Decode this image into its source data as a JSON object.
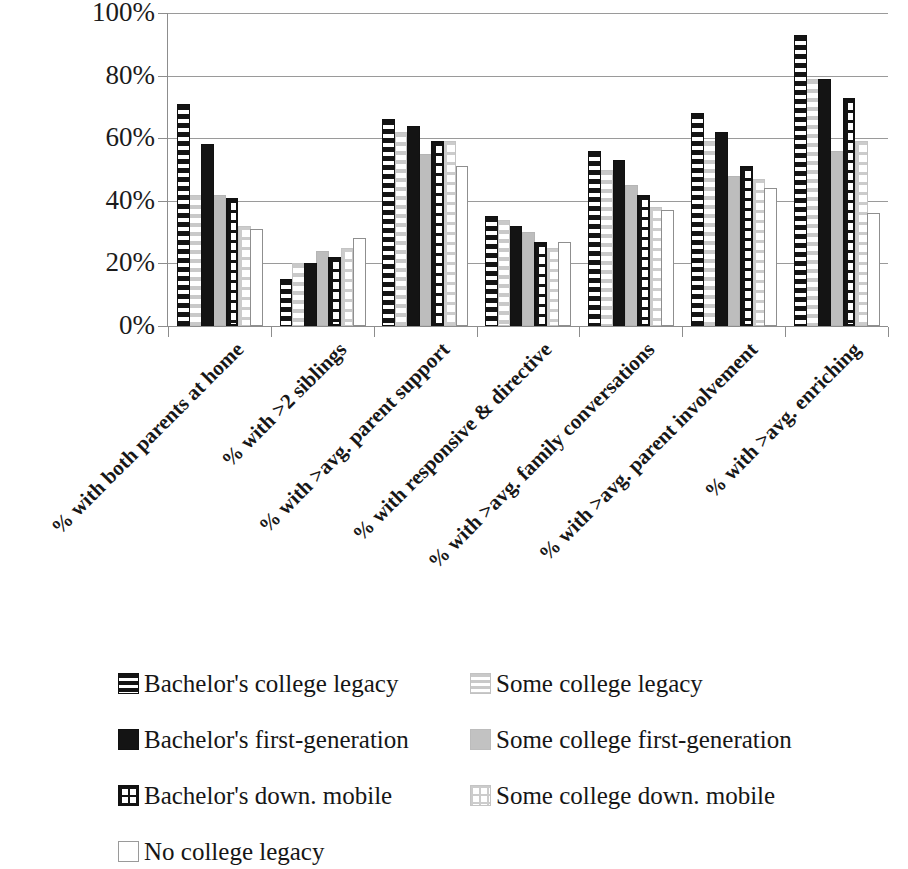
{
  "chart_data": {
    "type": "bar",
    "title": "",
    "subtitle": "",
    "xlabel": "",
    "ylabel": "",
    "ylim": [
      0,
      100
    ],
    "y_ticks": [
      "0%",
      "20%",
      "40%",
      "60%",
      "80%",
      "100%"
    ],
    "y_tick_values": [
      0,
      20,
      40,
      60,
      80,
      100
    ],
    "grid": "horizontal",
    "legend_position": "bottom",
    "categories": [
      "% with both parents at home",
      "% with >2 siblings",
      "% with >avg. parent support",
      "% with responsive & directive",
      "% with >avg. family conversations",
      "% with >avg. parent involvement",
      "% with >avg. enriching"
    ],
    "series": [
      {
        "name": "Bachelor's college legacy",
        "key": "bach-legacy",
        "values": [
          71,
          15,
          66,
          35,
          56,
          68,
          93
        ]
      },
      {
        "name": "Some college legacy",
        "key": "some-legacy",
        "values": [
          42,
          20,
          62,
          34,
          50,
          59,
          79
        ]
      },
      {
        "name": "Bachelor's first-generation",
        "key": "bach-firstgen",
        "values": [
          58,
          20,
          64,
          32,
          53,
          62,
          79
        ]
      },
      {
        "name": "Some college first-generation",
        "key": "some-firstgen",
        "values": [
          42,
          24,
          55,
          30,
          45,
          48,
          56
        ]
      },
      {
        "name": "Bachelor's down. mobile",
        "key": "bach-down",
        "values": [
          41,
          22,
          59,
          27,
          42,
          51,
          73
        ]
      },
      {
        "name": "Some college down. mobile",
        "key": "some-down",
        "values": [
          32,
          25,
          59,
          25,
          38,
          47,
          59
        ]
      },
      {
        "name": "No college legacy",
        "key": "no-legacy",
        "values": [
          31,
          28,
          51,
          27,
          37,
          44,
          36
        ]
      }
    ]
  },
  "legend": {
    "items": [
      {
        "label": "Bachelor's college legacy",
        "swatch": "sw-bach-legacy",
        "column": 0,
        "row": 0
      },
      {
        "label": "Bachelor's first-generation",
        "swatch": "sw-bach-firstgen",
        "column": 0,
        "row": 1
      },
      {
        "label": "Bachelor's down. mobile",
        "swatch": "sw-bach-down",
        "column": 0,
        "row": 2
      },
      {
        "label": "No college legacy",
        "swatch": "sw-no-legacy",
        "column": 0,
        "row": 3
      },
      {
        "label": "Some college legacy",
        "swatch": "sw-some-legacy",
        "column": 1,
        "row": 0
      },
      {
        "label": "Some college first-generation",
        "swatch": "sw-some-firstgen",
        "column": 1,
        "row": 1
      },
      {
        "label": "Some college down. mobile",
        "swatch": "sw-some-down",
        "column": 1,
        "row": 2
      }
    ]
  },
  "colors": {
    "dark": "#141414",
    "light_gray": "#c2c2c2",
    "gridline": "#9a9a9a",
    "axis": "#8d8d8d",
    "text": "#161616",
    "background": "#ffffff"
  }
}
